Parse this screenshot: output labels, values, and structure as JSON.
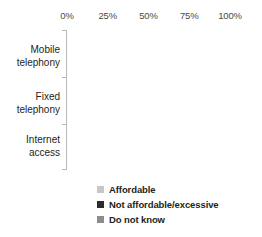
{
  "chart_data": {
    "type": "bar",
    "orientation": "horizontal",
    "stacked": true,
    "stacked_percent": true,
    "title": "",
    "subtitle": "",
    "xlabel": "",
    "ylabel": "",
    "xlim": [
      0,
      100
    ],
    "grid": false,
    "legend_position": "bottom",
    "categories": [
      "Mobile telephony",
      "Fixed telephony",
      "Internet access"
    ],
    "category_lines": [
      [
        "Mobile",
        "telephony"
      ],
      [
        "Fixed",
        "telephony"
      ],
      [
        "Internet",
        "access"
      ]
    ],
    "tick_labels": [
      "0%",
      "25%",
      "50%",
      "75%",
      "100%"
    ],
    "tick_values": [
      0,
      25,
      50,
      75,
      100
    ],
    "series": [
      {
        "name": "Affordable",
        "color": "#c7c7c7",
        "values": [
          79,
          80,
          84
        ]
      },
      {
        "name": "Not affordable/excessive",
        "color": "#2b2b2b",
        "values": [
          21,
          20,
          12
        ]
      },
      {
        "name": "Do not know",
        "color": "#8d8d8d",
        "values": [
          0,
          0,
          4
        ]
      }
    ],
    "legend": [
      {
        "label": "Affordable",
        "color": "#c7c7c7"
      },
      {
        "label": "Not affordable/excessive",
        "color": "#2b2b2b"
      },
      {
        "label": "Do not know",
        "color": "#8d8d8d"
      }
    ],
    "colors": {
      "affordable": "#c7c7c7",
      "not_affordable": "#2b2b2b",
      "do_not_know": "#8d8d8d",
      "axis": "#b9b9b9",
      "text": "#231f20",
      "tick_text": "#4a4a4a",
      "background": "#ffffff"
    }
  }
}
